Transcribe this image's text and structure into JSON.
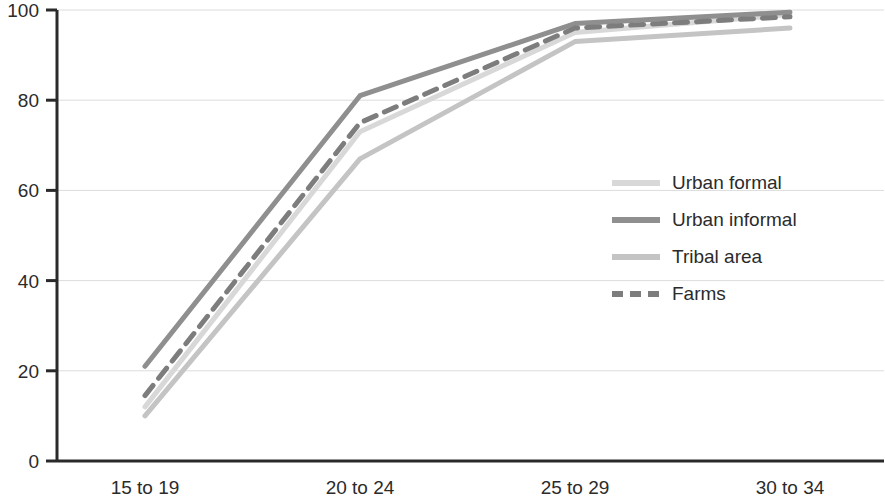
{
  "chart": {
    "type": "line",
    "title": "",
    "background_color": "#ffffff"
  },
  "chart_data": {
    "type": "line",
    "title": "",
    "subtitle": "",
    "xlabel": "",
    "ylabel": "",
    "categories": [
      "15 to 19",
      "20 to 24",
      "25 to 29",
      "30 to 34"
    ],
    "ylim": [
      0,
      100
    ],
    "yticks": [
      0,
      20,
      40,
      60,
      80,
      100
    ],
    "grid": "horizontal",
    "legend_position": "center-right",
    "series": [
      {
        "name": "Urban formal",
        "color": "#d8d8d8",
        "style": "solid",
        "width": 5,
        "values": [
          12,
          73,
          95,
          99
        ]
      },
      {
        "name": "Urban informal",
        "color": "#8f8f8f",
        "style": "solid",
        "width": 5,
        "values": [
          21,
          81,
          97,
          99.5
        ]
      },
      {
        "name": "Tribal area",
        "color": "#c4c4c4",
        "style": "solid",
        "width": 5,
        "values": [
          10,
          67,
          93,
          96
        ]
      },
      {
        "name": "Farms",
        "color": "#7d7d7d",
        "style": "dashed",
        "width": 5,
        "values": [
          14.5,
          75,
          96,
          98.5
        ]
      }
    ]
  },
  "axes": {
    "y_tick_labels": [
      "0",
      "20",
      "40",
      "60",
      "80",
      "100"
    ],
    "x_tick_labels": [
      "15 to 19",
      "20 to 24",
      "25 to 29",
      "30 to 34"
    ]
  },
  "legend": {
    "items": [
      {
        "label": "Urban formal",
        "color": "#d8d8d8",
        "style": "solid"
      },
      {
        "label": "Urban informal",
        "color": "#8f8f8f",
        "style": "solid"
      },
      {
        "label": "Tribal area",
        "color": "#c4c4c4",
        "style": "solid"
      },
      {
        "label": "Farms",
        "color": "#7d7d7d",
        "style": "dashed"
      }
    ]
  }
}
